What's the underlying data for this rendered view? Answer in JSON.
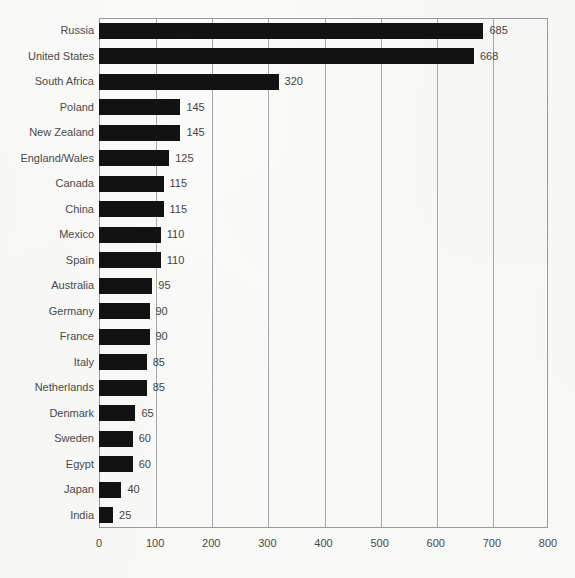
{
  "chart_data": {
    "type": "bar",
    "orientation": "horizontal",
    "title": "",
    "subtitle": "",
    "xlabel": "",
    "ylabel": "",
    "xlim": [
      0,
      800
    ],
    "xticks": [
      "0",
      "100",
      "200",
      "300",
      "400",
      "500",
      "600",
      "700",
      "800"
    ],
    "xtick_values": [
      0,
      100,
      200,
      300,
      400,
      500,
      600,
      700,
      800
    ],
    "grid": "vertical",
    "legend": "none",
    "bar_color": "#121212",
    "grid_color": "#a8a8a8",
    "axis_color": "#9b9b9b",
    "text_color": "#4a4a4a",
    "background_color": "#fbfbf9",
    "categories": [
      "Russia",
      "United States",
      "South Africa",
      "Poland",
      "New Zealand",
      "England/Wales",
      "Canada",
      "China",
      "Mexico",
      "Spain",
      "Australia",
      "Germany",
      "France",
      "Italy",
      "Netherlands",
      "Denmark",
      "Sweden",
      "Egypt",
      "Japan",
      "India"
    ],
    "values": [
      685,
      668,
      320,
      145,
      145,
      125,
      115,
      115,
      110,
      110,
      95,
      90,
      90,
      85,
      85,
      65,
      60,
      60,
      40,
      25
    ],
    "value_labels": [
      "685",
      "668",
      "320",
      "145",
      "145",
      "125",
      "115",
      "115",
      "110",
      "110",
      "95",
      "90",
      "90",
      "85",
      "85",
      "65",
      "60",
      "60",
      "40",
      "25"
    ]
  }
}
